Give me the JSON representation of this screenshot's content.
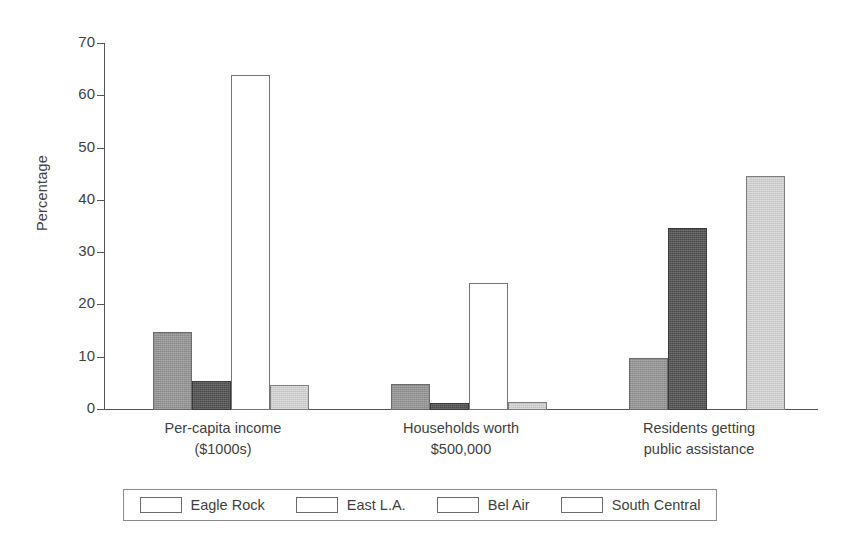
{
  "chart_data": {
    "type": "bar",
    "title": "",
    "xlabel": "",
    "ylabel": "Percentage",
    "ylim": [
      0,
      70
    ],
    "yticks": [
      0,
      10,
      20,
      30,
      40,
      50,
      60,
      70
    ],
    "grid": false,
    "legend_position": "bottom",
    "categories": [
      "Per-capita income ($1000s)",
      "Households worth $500,000",
      "Residents getting public assistance"
    ],
    "category_lines": [
      [
        "Per-capita income",
        "($1000s)"
      ],
      [
        "Households worth",
        "$500,000"
      ],
      [
        "Residents getting",
        "public assistance"
      ]
    ],
    "series": [
      {
        "name": "Eagle Rock",
        "color": "#949494",
        "values": [
          15.0,
          5.0,
          10.0
        ]
      },
      {
        "name": "East L.A.",
        "color": "#4b4b4b",
        "values": [
          5.5,
          1.3,
          34.8
        ]
      },
      {
        "name": "Bel Air",
        "color": "#ffffff",
        "values": [
          64.0,
          24.2,
          0
        ]
      },
      {
        "name": "South Central",
        "color": "#cccccc",
        "values": [
          4.7,
          1.5,
          44.7
        ]
      }
    ]
  },
  "axis": {
    "y_label": "Percentage",
    "tick_labels": [
      "70",
      "60",
      "50",
      "40",
      "30",
      "20",
      "10",
      "0"
    ]
  },
  "legend": {
    "items": [
      {
        "label": "Eagle Rock"
      },
      {
        "label": "East L.A."
      },
      {
        "label": "Bel Air"
      },
      {
        "label": "South Central"
      }
    ]
  }
}
